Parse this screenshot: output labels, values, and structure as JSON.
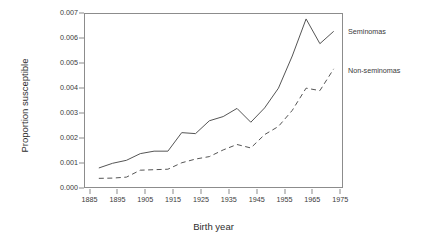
{
  "chart_data": {
    "type": "line",
    "title": "",
    "subtitle": "",
    "xlabel": "Birth year",
    "ylabel": "Proportion susceptible",
    "xlim": [
      1883,
      1976
    ],
    "ylim": [
      0.0,
      0.007
    ],
    "grid": false,
    "legend_position": "right-inline-annotation",
    "xticks": [
      1885,
      1895,
      1905,
      1915,
      1925,
      1935,
      1945,
      1955,
      1965,
      1975
    ],
    "xtick_labels": [
      "1885",
      "1895",
      "1905",
      "1915",
      "1925",
      "1935",
      "1945",
      "1955",
      "1965",
      "1975"
    ],
    "yticks": [
      0.0,
      0.001,
      0.002,
      0.003,
      0.004,
      0.005,
      0.006,
      0.007
    ],
    "ytick_labels": [
      "0.000",
      "0.001",
      "0.002",
      "0.003",
      "0.004",
      "0.005",
      "0.006",
      "0.007"
    ],
    "x": [
      1888,
      1893,
      1898,
      1903,
      1908,
      1913,
      1918,
      1923,
      1928,
      1933,
      1938,
      1943,
      1948,
      1953,
      1958,
      1963,
      1968,
      1973
    ],
    "series": [
      {
        "name": "Seminomas",
        "style": "solid",
        "color": "#555555",
        "values": [
          0.00077,
          0.00096,
          0.00108,
          0.00135,
          0.00145,
          0.00145,
          0.0022,
          0.00216,
          0.00268,
          0.00285,
          0.00318,
          0.00262,
          0.0032,
          0.004,
          0.0053,
          0.0068,
          0.0058,
          0.0063
        ]
      },
      {
        "name": "Non-seminomas",
        "style": "dashed",
        "color": "#555555",
        "values": [
          0.00035,
          0.00036,
          0.0004,
          0.00068,
          0.0007,
          0.00072,
          0.00098,
          0.00113,
          0.00123,
          0.0015,
          0.00172,
          0.00158,
          0.00212,
          0.00245,
          0.0031,
          0.004,
          0.0039,
          0.00478
        ]
      }
    ],
    "annotations": [
      {
        "text": "Seminomas",
        "anchor_series": "Seminomas"
      },
      {
        "text": "Non-seminomas",
        "anchor_series": "Non-seminomas"
      }
    ]
  },
  "axes": {
    "frame_color": "#8c8c8c",
    "tick_text_color": "#3a3a3a",
    "label_text_color": "#2e2e2e"
  }
}
